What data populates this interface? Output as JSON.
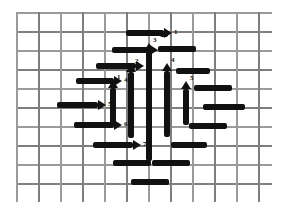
{
  "figure": {
    "background_color": "#ffffff",
    "mesh_color": "#9a9a9a",
    "mark_color": "#111111",
    "mesh": {
      "left": 16,
      "top": 12,
      "width": 256,
      "height": 190,
      "h_spacing": 19,
      "v_spacing": 22,
      "h_line_count": 11,
      "v_line_count": 12
    },
    "horizontal_arrows": [
      {
        "id": "h1",
        "label": "1",
        "x": 126,
        "y": 33,
        "length": 38
      },
      {
        "id": "h2",
        "label": "3",
        "x": 96,
        "y": 66,
        "length": 40
      },
      {
        "id": "h3",
        "label": "4",
        "x": 76,
        "y": 81,
        "length": 38
      },
      {
        "id": "h4",
        "label": "5",
        "x": 57,
        "y": 105,
        "length": 41
      },
      {
        "id": "h5",
        "label": "6",
        "x": 74,
        "y": 125,
        "length": 40
      },
      {
        "id": "h6",
        "label": "7",
        "x": 93,
        "y": 145,
        "length": 40
      },
      {
        "id": "h7",
        "label": "",
        "x": 112,
        "y": 50,
        "length": 38
      }
    ],
    "vertical_arrows": [
      {
        "id": "v1",
        "label": "1",
        "x": 113,
        "y": 88,
        "length": 36
      },
      {
        "id": "v2",
        "label": "2",
        "x": 131,
        "y": 72,
        "length": 66
      },
      {
        "id": "v3",
        "label": "3",
        "x": 149,
        "y": 51,
        "length": 110
      },
      {
        "id": "v4",
        "label": "4",
        "x": 167,
        "y": 71,
        "length": 66
      },
      {
        "id": "v5",
        "label": "5",
        "x": 186,
        "y": 89,
        "length": 36
      }
    ],
    "plain_bars": [
      {
        "id": "b1",
        "orientation": "h",
        "x": 158,
        "y": 49,
        "length": 38
      },
      {
        "id": "b2",
        "orientation": "h",
        "x": 176,
        "y": 71,
        "length": 34
      },
      {
        "id": "b3",
        "orientation": "h",
        "x": 194,
        "y": 88,
        "length": 38
      },
      {
        "id": "b4",
        "orientation": "h",
        "x": 203,
        "y": 107,
        "length": 42
      },
      {
        "id": "b5",
        "orientation": "h",
        "x": 189,
        "y": 126,
        "length": 38
      },
      {
        "id": "b6",
        "orientation": "h",
        "x": 171,
        "y": 145,
        "length": 36
      },
      {
        "id": "b7",
        "orientation": "h",
        "x": 113,
        "y": 163,
        "length": 38
      },
      {
        "id": "b8",
        "orientation": "h",
        "x": 152,
        "y": 163,
        "length": 38
      },
      {
        "id": "b9",
        "orientation": "h",
        "x": 131,
        "y": 182,
        "length": 38
      },
      {
        "id": "b10",
        "orientation": "h",
        "x": 160,
        "y": 34,
        "length": 8
      }
    ]
  }
}
